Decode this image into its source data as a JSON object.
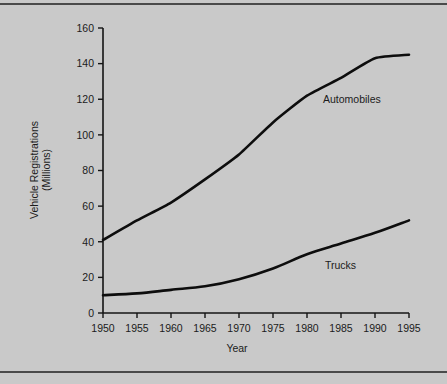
{
  "figure": {
    "background_color": "#c9c9c9",
    "line_color": "#0d0d0d",
    "rule_color": "#4a4a4a"
  },
  "chart_data": {
    "type": "line",
    "title": "",
    "xlabel": "Year",
    "ylabel": "Vehicle Registrations (Millions)",
    "ylabel_line1": "Vehicle Registrations",
    "ylabel_line2": "(Millions)",
    "x": [
      1950,
      1955,
      1960,
      1965,
      1970,
      1975,
      1980,
      1985,
      1990,
      1995
    ],
    "xtick_labels": [
      "1950",
      "1955",
      "1960",
      "1965",
      "1970",
      "1975",
      "1980",
      "1985",
      "1990",
      "1995"
    ],
    "ytick_labels": [
      "0",
      "20",
      "40",
      "60",
      "80",
      "100",
      "120",
      "140",
      "160"
    ],
    "yticks": [
      0,
      20,
      40,
      60,
      80,
      100,
      120,
      140,
      160
    ],
    "xlim": [
      1950,
      1995
    ],
    "ylim": [
      0,
      160
    ],
    "grid": false,
    "legend": "inline-labels",
    "series": [
      {
        "name": "Automobiles",
        "label_text": "Automobiles",
        "values": [
          41,
          52,
          62,
          75,
          89,
          107,
          122,
          132,
          143,
          145
        ]
      },
      {
        "name": "Trucks",
        "label_text": "Trucks",
        "values": [
          10,
          11,
          13,
          15,
          19,
          25,
          33,
          39,
          45,
          52
        ]
      }
    ]
  }
}
